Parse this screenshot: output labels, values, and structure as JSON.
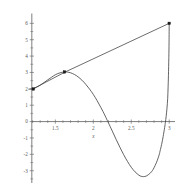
{
  "chart_data": {
    "type": "line",
    "title": "",
    "subtitle": "",
    "xlabel": "x",
    "ylabel": "",
    "xlim": [
      1.12,
      3.05
    ],
    "ylim": [
      -3.75,
      6.6
    ],
    "grid": false,
    "legend": "none",
    "axis_color": "#6e6e6e",
    "curve_color": "#3c3c3c",
    "secant_color": "#3c3c3c",
    "marker_color": "#1a1a1a",
    "background": "#ffffff",
    "x_ticks": [
      {
        "value": 1.5,
        "label": "1.5"
      },
      {
        "value": 2.0,
        "label": "2"
      },
      {
        "value": 2.5,
        "label": "2.5"
      },
      {
        "value": 3.0,
        "label": "3"
      }
    ],
    "y_ticks": [
      {
        "value": 6,
        "label": "6"
      },
      {
        "value": 5,
        "label": "5"
      },
      {
        "value": 4,
        "label": "4"
      },
      {
        "value": 3,
        "label": "3"
      },
      {
        "value": 2,
        "label": "2"
      },
      {
        "value": 1,
        "label": "1"
      },
      {
        "value": 0,
        "label": "0"
      },
      {
        "value": -1,
        "label": "-1"
      },
      {
        "value": -2,
        "label": "-2"
      },
      {
        "value": -3,
        "label": "-3"
      }
    ],
    "x_minor_ticks": [
      1.2,
      1.3,
      1.4,
      1.6,
      1.7,
      1.8,
      1.9,
      2.1,
      2.2,
      2.3,
      2.4,
      2.6,
      2.7,
      2.8,
      2.9
    ],
    "y_minor_ticks": [
      5.5,
      4.5,
      3.5,
      2.5,
      1.5,
      0.5,
      -0.5,
      -1.5,
      -2.5,
      -3.5
    ],
    "series": [
      {
        "name": "curve",
        "kind": "curve",
        "points": [
          [
            1.15,
            1.98
          ],
          [
            1.2,
            2.0
          ],
          [
            1.25,
            2.09
          ],
          [
            1.3,
            2.22
          ],
          [
            1.35,
            2.38
          ],
          [
            1.4,
            2.55
          ],
          [
            1.45,
            2.71
          ],
          [
            1.5,
            2.86
          ],
          [
            1.55,
            2.96
          ],
          [
            1.6,
            3.02
          ],
          [
            1.63,
            3.03
          ],
          [
            1.66,
            3.02
          ],
          [
            1.7,
            2.98
          ],
          [
            1.75,
            2.88
          ],
          [
            1.8,
            2.73
          ],
          [
            1.85,
            2.53
          ],
          [
            1.9,
            2.28
          ],
          [
            1.95,
            1.99
          ],
          [
            2.0,
            1.66
          ],
          [
            2.05,
            1.28
          ],
          [
            2.1,
            0.86
          ],
          [
            2.15,
            0.41
          ],
          [
            2.18,
            0.11
          ],
          [
            2.2,
            -0.08
          ],
          [
            2.25,
            -0.58
          ],
          [
            2.3,
            -1.08
          ],
          [
            2.35,
            -1.56
          ],
          [
            2.4,
            -2.02
          ],
          [
            2.45,
            -2.43
          ],
          [
            2.5,
            -2.79
          ],
          [
            2.55,
            -3.07
          ],
          [
            2.6,
            -3.27
          ],
          [
            2.63,
            -3.34
          ],
          [
            2.66,
            -3.36
          ],
          [
            2.7,
            -3.32
          ],
          [
            2.75,
            -3.15
          ],
          [
            2.78,
            -2.98
          ],
          [
            2.8,
            -2.82
          ],
          [
            2.83,
            -2.52
          ],
          [
            2.85,
            -2.28
          ],
          [
            2.87,
            -1.99
          ],
          [
            2.88,
            -1.79
          ],
          [
            2.9,
            -1.4
          ],
          [
            2.92,
            -0.92
          ],
          [
            2.94,
            -0.36
          ],
          [
            2.95,
            -0.04
          ],
          [
            2.96,
            0.32
          ],
          [
            2.97,
            0.78
          ],
          [
            2.98,
            1.42
          ],
          [
            2.985,
            2.05
          ],
          [
            2.99,
            2.82
          ],
          [
            2.995,
            3.9
          ],
          [
            2.998,
            4.85
          ],
          [
            3.0,
            6.0
          ]
        ]
      },
      {
        "name": "secant",
        "kind": "line",
        "points": [
          [
            1.19,
            1.96
          ],
          [
            1.63,
            3.03
          ],
          [
            3.0,
            6.0
          ]
        ]
      }
    ],
    "markers": [
      {
        "x": 1.21,
        "y": 1.99,
        "label": ""
      },
      {
        "x": 1.62,
        "y": 3.03,
        "label": ""
      },
      {
        "x": 3.0,
        "y": 6.0,
        "label": ""
      }
    ],
    "annotations": []
  }
}
